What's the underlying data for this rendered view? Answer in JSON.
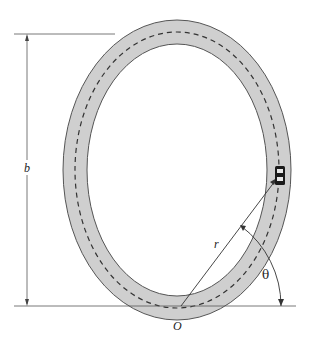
{
  "figure": {
    "colors": {
      "background": "#ffffff",
      "track_fill": "#cfcfcf",
      "track_edge": "#555555",
      "centerline": "#333333",
      "lines": "#444444",
      "car_body": "#1a1a1a",
      "car_window": "#e8e8e8"
    },
    "labels": {
      "height_label": "b",
      "radius_label": "r",
      "angle_label": "θ",
      "origin_label": "O"
    },
    "quantities": {
      "angle_theta_deg": 53
    }
  }
}
